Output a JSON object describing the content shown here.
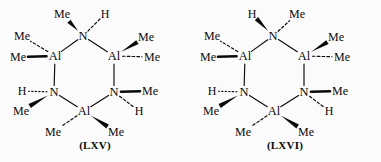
{
  "figure": {
    "background_color": "#fbfbfb",
    "ink_color": "#0a0a0a",
    "structure_count": 2
  },
  "structures": [
    {
      "id": "lxv",
      "caption": "(LXV)",
      "ring_type": "Al3N3 six-membered ring",
      "ring_atoms": [
        {
          "key": "n_top",
          "label": "N",
          "x": 83,
          "y": 36
        },
        {
          "key": "al_right_top",
          "label": "Al",
          "x": 114,
          "y": 56
        },
        {
          "key": "n_right_bottom",
          "label": "N",
          "x": 114,
          "y": 92
        },
        {
          "key": "al_bottom",
          "label": "Al",
          "x": 84,
          "y": 111
        },
        {
          "key": "n_left_bottom",
          "label": "N",
          "x": 54,
          "y": 92
        },
        {
          "key": "al_left_top",
          "label": "Al",
          "x": 55,
          "y": 56
        }
      ],
      "substituents": [
        {
          "key": "me_top_left",
          "label": "Me",
          "x": 62,
          "y": 14,
          "from": "n_top",
          "bond": "wedge"
        },
        {
          "key": "h_top_right",
          "label": "H",
          "x": 105,
          "y": 14,
          "from": "n_top",
          "bond": "dash"
        },
        {
          "key": "me_upper_left",
          "label": "Me",
          "x": 22,
          "y": 36,
          "from": "al_left_top",
          "bond": "dash"
        },
        {
          "key": "me_left",
          "label": "Me",
          "x": 18,
          "y": 57,
          "from": "al_left_top",
          "bond": "bold"
        },
        {
          "key": "me_upper_right",
          "label": "Me",
          "x": 146,
          "y": 37,
          "from": "al_right_top",
          "bond": "wedge"
        },
        {
          "key": "me_right",
          "label": "Me",
          "x": 152,
          "y": 57,
          "from": "al_right_top",
          "bond": "dash"
        },
        {
          "key": "h_mid_left",
          "label": "H",
          "x": 22,
          "y": 91,
          "from": "n_left_bottom",
          "bond": "dot"
        },
        {
          "key": "me_lower_left",
          "label": "Me",
          "x": 21,
          "y": 111,
          "from": "n_left_bottom",
          "bond": "wedge"
        },
        {
          "key": "me_mid_right",
          "label": "Me",
          "x": 150,
          "y": 91,
          "from": "n_right_bottom",
          "bond": "bold"
        },
        {
          "key": "h_lower_right",
          "label": "H",
          "x": 139,
          "y": 111,
          "from": "n_right_bottom",
          "bond": "dash"
        },
        {
          "key": "me_bottom_left",
          "label": "Me",
          "x": 53,
          "y": 132,
          "from": "al_bottom",
          "bond": "dash"
        },
        {
          "key": "me_bottom_right",
          "label": "Me",
          "x": 116,
          "y": 132,
          "from": "al_bottom",
          "bond": "wedge"
        }
      ]
    },
    {
      "id": "lxvi",
      "caption": "(LXVI)",
      "ring_type": "Al3N3 six-membered ring",
      "ring_atoms": [
        {
          "key": "n_top",
          "label": "N",
          "x": 83,
          "y": 36
        },
        {
          "key": "al_right_top",
          "label": "Al",
          "x": 114,
          "y": 56
        },
        {
          "key": "n_right_bottom",
          "label": "N",
          "x": 114,
          "y": 92
        },
        {
          "key": "al_bottom",
          "label": "Al",
          "x": 84,
          "y": 111
        },
        {
          "key": "n_left_bottom",
          "label": "N",
          "x": 54,
          "y": 92
        },
        {
          "key": "al_left_top",
          "label": "Al",
          "x": 55,
          "y": 56
        }
      ],
      "substituents": [
        {
          "key": "h_top_left",
          "label": "H",
          "x": 62,
          "y": 14,
          "from": "n_top",
          "bond": "wedge"
        },
        {
          "key": "me_top_right",
          "label": "Me",
          "x": 107,
          "y": 14,
          "from": "n_top",
          "bond": "dash"
        },
        {
          "key": "me_upper_left",
          "label": "Me",
          "x": 22,
          "y": 36,
          "from": "al_left_top",
          "bond": "dash"
        },
        {
          "key": "me_left",
          "label": "Me",
          "x": 18,
          "y": 57,
          "from": "al_left_top",
          "bond": "bold"
        },
        {
          "key": "me_upper_right",
          "label": "Me",
          "x": 146,
          "y": 37,
          "from": "al_right_top",
          "bond": "wedge"
        },
        {
          "key": "me_right",
          "label": "Me",
          "x": 152,
          "y": 57,
          "from": "al_right_top",
          "bond": "dash"
        },
        {
          "key": "h_mid_left",
          "label": "H",
          "x": 22,
          "y": 91,
          "from": "n_left_bottom",
          "bond": "dot"
        },
        {
          "key": "me_lower_left",
          "label": "Me",
          "x": 21,
          "y": 111,
          "from": "n_left_bottom",
          "bond": "wedge"
        },
        {
          "key": "me_mid_right",
          "label": "Me",
          "x": 150,
          "y": 91,
          "from": "n_right_bottom",
          "bond": "bold"
        },
        {
          "key": "h_lower_right",
          "label": "H",
          "x": 139,
          "y": 111,
          "from": "n_right_bottom",
          "bond": "dash"
        },
        {
          "key": "me_bottom_left",
          "label": "Me",
          "x": 53,
          "y": 132,
          "from": "al_bottom",
          "bond": "dash"
        },
        {
          "key": "me_bottom_right",
          "label": "Me",
          "x": 116,
          "y": 132,
          "from": "al_bottom",
          "bond": "wedge"
        }
      ]
    }
  ]
}
